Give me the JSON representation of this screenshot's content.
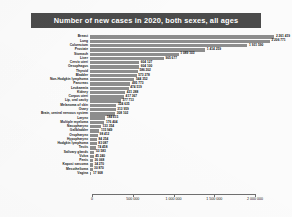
{
  "chart_data": {
    "type": "bar",
    "orientation": "horizontal",
    "title": "Number of new cases in 2020, both sexes, all ages",
    "xlabel": "",
    "ylabel": "",
    "xlim": [
      0,
      2250000
    ],
    "grid": false,
    "legend": null,
    "xticks": [
      0,
      500000,
      1000000,
      1500000,
      2000000
    ],
    "xtick_labels": [
      "0",
      "500 000",
      "1 000 000",
      "1 500 000",
      "2 000 000"
    ],
    "bar_color": "#8d8d8d",
    "title_band_color": "#4b4b4b",
    "title_text_color": "#ffffff",
    "categories": [
      "Breast",
      "Lung",
      "Colorectum",
      "Prostate",
      "Stomach",
      "Liver",
      "Cervix uteri",
      "Oesophagus",
      "Thyroid",
      "Bladder",
      "Non-Hodgkin lymphoma",
      "Pancreas",
      "Leukaemia",
      "Kidney",
      "Corpus uteri",
      "Lip, oral cavity",
      "Melanoma of skin",
      "Ovary",
      "Brain, central nervous system",
      "Larynx",
      "Multiple myeloma",
      "Nasopharynx",
      "Gallbladder",
      "Oropharynx",
      "Hypopharynx",
      "Hodgkin lymphoma",
      "Testis",
      "Salivary glands",
      "Vulva",
      "Penis",
      "Kaposi sarcoma",
      "Mesothelioma",
      "Vagina"
    ],
    "values": [
      2261419,
      2206771,
      1931590,
      1414259,
      1089103,
      905677,
      604127,
      604100,
      586202,
      573278,
      544352,
      495773,
      474519,
      431288,
      417367,
      377713,
      324635,
      313959,
      308102,
      184615,
      176404,
      133354,
      115949,
      98412,
      84254,
      83087,
      74458,
      53583,
      45240,
      36068,
      34270,
      30870,
      17908
    ],
    "value_labels": [
      "2 261 419",
      "2 206 771",
      "1 931 590",
      "1 414 259",
      "1 089 103",
      "905 677",
      "604 127",
      "604 100",
      "586 202",
      "573 278",
      "544 352",
      "495 773",
      "474 519",
      "431 288",
      "417 367",
      "377 713",
      "324 635",
      "313 959",
      "308 102",
      "184 615",
      "176 404",
      "133 354",
      "115 949",
      "98 412",
      "84 254",
      "83 087",
      "74 458",
      "53 583",
      "45 240",
      "36 068",
      "34 270",
      "30 870",
      "17 908"
    ]
  }
}
